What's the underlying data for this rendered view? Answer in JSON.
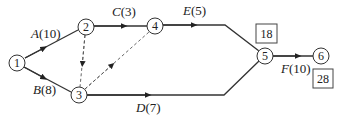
{
  "diagram": {
    "type": "activity-on-arrow network",
    "nodes": [
      {
        "id": "1",
        "label": "1"
      },
      {
        "id": "2",
        "label": "2"
      },
      {
        "id": "3",
        "label": "3"
      },
      {
        "id": "4",
        "label": "4"
      },
      {
        "id": "5",
        "label": "5"
      },
      {
        "id": "6",
        "label": "6"
      }
    ],
    "activities": [
      {
        "from": "1",
        "to": "2",
        "name": "A",
        "duration": "10",
        "label": "A(10)"
      },
      {
        "from": "1",
        "to": "3",
        "name": "B",
        "duration": "8",
        "label": "B(8)"
      },
      {
        "from": "2",
        "to": "4",
        "name": "C",
        "duration": "3",
        "label": "C(3)"
      },
      {
        "from": "3",
        "to": "5",
        "name": "D",
        "duration": "7",
        "label": "D(7)"
      },
      {
        "from": "4",
        "to": "5",
        "name": "E",
        "duration": "5",
        "label": "E(5)"
      },
      {
        "from": "5",
        "to": "6",
        "name": "F",
        "duration": "10",
        "label": "F(10)"
      }
    ],
    "dummy_activities": [
      {
        "from": "2",
        "to": "3"
      },
      {
        "from": "3",
        "to": "4"
      }
    ],
    "event_times": [
      {
        "node": "5",
        "value": "18"
      },
      {
        "node": "6",
        "value": "28"
      }
    ]
  },
  "labels": {
    "A_name": "A",
    "A_dur": "(10)",
    "B_name": "B",
    "B_dur": "(8)",
    "C_name": "C",
    "C_dur": "(3)",
    "D_name": "D",
    "D_dur": "(7)",
    "E_name": "E",
    "E_dur": "(5)",
    "F_name": "F",
    "F_dur": "(10)"
  }
}
